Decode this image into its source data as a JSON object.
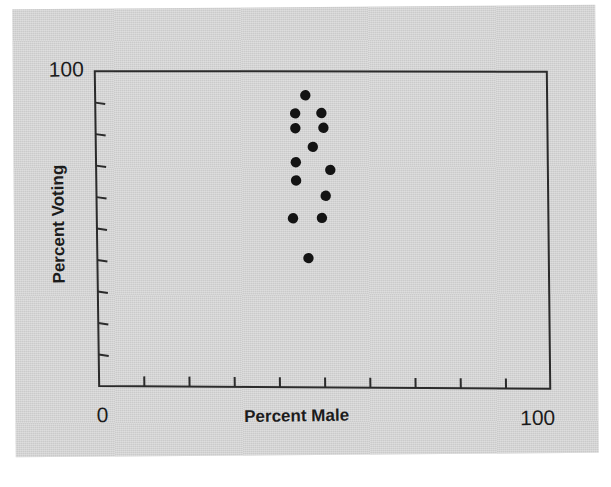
{
  "figure": {
    "background_color": "#d3d3d3",
    "page_color": "#ffffff",
    "ink_color": "#2b2b2b"
  },
  "labels": {
    "y_axis_title": "Percent Voting",
    "x_axis_title": "Percent Male",
    "y_max_label": "100",
    "x_min_label": "0",
    "x_max_label": "100"
  },
  "chart_data": {
    "type": "scatter",
    "title": "",
    "xlabel": "Percent Male",
    "ylabel": "Percent Voting",
    "xlim": [
      0,
      100
    ],
    "ylim": [
      0,
      100
    ],
    "xticks": [
      0,
      10,
      20,
      30,
      40,
      50,
      60,
      70,
      80,
      90,
      100
    ],
    "yticks": [
      0,
      10,
      20,
      30,
      40,
      50,
      60,
      70,
      80,
      90,
      100
    ],
    "xtick_labels_shown": [
      "0",
      "100"
    ],
    "ytick_labels_shown": [
      "100"
    ],
    "grid": false,
    "legend": false,
    "marker": "filled-circle",
    "marker_color": "#141414",
    "marker_size": 6,
    "n_points": 13,
    "x": [
      46.5,
      44.2,
      50.0,
      44.2,
      50.4,
      48.0,
      44.2,
      51.8,
      44.2,
      50.7,
      43.4,
      49.8,
      46.7
    ],
    "y": [
      91.4,
      85.7,
      85.7,
      81.0,
      81.0,
      75.0,
      70.2,
      67.6,
      64.4,
      59.4,
      52.4,
      52.4,
      39.7
    ],
    "points": [
      {
        "x": 46.5,
        "y": 91.4
      },
      {
        "x": 44.2,
        "y": 85.7
      },
      {
        "x": 50.0,
        "y": 85.7
      },
      {
        "x": 44.2,
        "y": 81.0
      },
      {
        "x": 50.4,
        "y": 81.0
      },
      {
        "x": 48.0,
        "y": 75.0
      },
      {
        "x": 44.2,
        "y": 70.2
      },
      {
        "x": 51.8,
        "y": 67.6
      },
      {
        "x": 44.2,
        "y": 64.4
      },
      {
        "x": 50.7,
        "y": 59.4
      },
      {
        "x": 43.4,
        "y": 52.4
      },
      {
        "x": 49.8,
        "y": 52.4
      },
      {
        "x": 46.7,
        "y": 39.7
      }
    ]
  },
  "plot_geometry": {
    "left": 97,
    "right": 549,
    "top": 68,
    "bottom": 383,
    "tick_length": 10
  }
}
